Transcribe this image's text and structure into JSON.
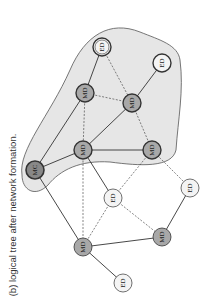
{
  "caption": "(b) logical tree after network formation.",
  "colors": {
    "region_fill": "#e6e6e6",
    "region_stroke": "#555555",
    "coordinator_fill": "#888888",
    "router_fill": "#a8a8a8",
    "end_device_fill": "#f4f4f4",
    "edge": "#333333"
  },
  "nodes": [
    {
      "id": "mc",
      "label": "MC",
      "type": "coordinator",
      "x": 35,
      "y": 170,
      "in_tree": true
    },
    {
      "id": "md1",
      "label": "MD",
      "type": "router",
      "x": 85,
      "y": 93,
      "in_tree": true
    },
    {
      "id": "md2",
      "label": "MD",
      "type": "router",
      "x": 83,
      "y": 150,
      "in_tree": true
    },
    {
      "id": "md3",
      "label": "MD",
      "type": "router",
      "x": 132,
      "y": 103,
      "in_tree": true
    },
    {
      "id": "md4",
      "label": "MD",
      "type": "router",
      "x": 152,
      "y": 150,
      "in_tree": true
    },
    {
      "id": "ed1",
      "label": "ED",
      "type": "end_device_double",
      "x": 102,
      "y": 47,
      "in_tree": true
    },
    {
      "id": "ed2",
      "label": "ED",
      "type": "end_device",
      "x": 162,
      "y": 63,
      "in_tree": true
    },
    {
      "id": "ed3",
      "label": "ED",
      "type": "end_device",
      "x": 113,
      "y": 198,
      "in_tree": false
    },
    {
      "id": "ed4",
      "label": "ED",
      "type": "end_device",
      "x": 190,
      "y": 188,
      "in_tree": false
    },
    {
      "id": "md5",
      "label": "MD",
      "type": "router",
      "x": 83,
      "y": 247,
      "in_tree": false
    },
    {
      "id": "md6",
      "label": "MD",
      "type": "router",
      "x": 162,
      "y": 237,
      "in_tree": false
    },
    {
      "id": "ed5",
      "label": "ED",
      "type": "end_device",
      "x": 123,
      "y": 283,
      "in_tree": false
    }
  ],
  "edges": [
    {
      "from": "mc",
      "to": "md1",
      "style": "solid"
    },
    {
      "from": "mc",
      "to": "md2",
      "style": "solid"
    },
    {
      "from": "mc",
      "to": "md5",
      "style": "solid"
    },
    {
      "from": "md1",
      "to": "ed1",
      "style": "solid"
    },
    {
      "from": "md2",
      "to": "md3",
      "style": "solid"
    },
    {
      "from": "md2",
      "to": "md4",
      "style": "solid"
    },
    {
      "from": "md2",
      "to": "ed3",
      "style": "solid"
    },
    {
      "from": "md3",
      "to": "ed2",
      "style": "solid"
    },
    {
      "from": "md5",
      "to": "md6",
      "style": "solid"
    },
    {
      "from": "md5",
      "to": "ed5",
      "style": "solid"
    },
    {
      "from": "md6",
      "to": "ed4",
      "style": "solid"
    },
    {
      "from": "md1",
      "to": "md3",
      "style": "dashed"
    },
    {
      "from": "ed1",
      "to": "md3",
      "style": "dashed"
    },
    {
      "from": "md1",
      "to": "md2",
      "style": "dashed"
    },
    {
      "from": "md2",
      "to": "md5",
      "style": "dashed"
    },
    {
      "from": "md3",
      "to": "md4",
      "style": "dashed"
    },
    {
      "from": "md4",
      "to": "ed3",
      "style": "dashed"
    },
    {
      "from": "md4",
      "to": "ed4",
      "style": "dashed"
    },
    {
      "from": "ed3",
      "to": "md5",
      "style": "dashed"
    },
    {
      "from": "ed3",
      "to": "md6",
      "style": "dashed"
    }
  ]
}
